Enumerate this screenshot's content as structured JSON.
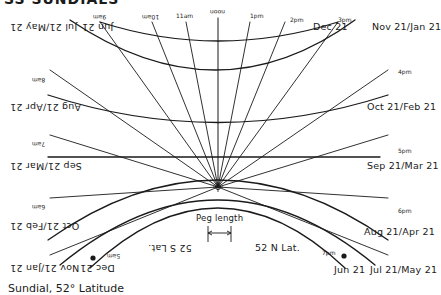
{
  "header": {
    "title_fragment": "SS SUNDIALS"
  },
  "caption": "Sundial, 52° Latitude",
  "peg": {
    "label": "Peg length"
  },
  "latitudes": {
    "north": "52 N Lat.",
    "south": "52 S Lat."
  },
  "north_dates": {
    "dec21": "Dec 21",
    "nov_jan": "Nov 21/Jan 21",
    "oct_feb": "Oct 21/Feb 21",
    "sep_mar": "Sep 21/Mar 21",
    "aug_apr": "Aug 21/Apr 21",
    "jul_may": "Jul 21/May 21",
    "jun21": "Jun 21"
  },
  "south_dates": {
    "jun21": "Jun 21",
    "jul_may": "Jul 21/May 21",
    "aug_apr": "Aug 21/Apr 21",
    "sep_mar": "Sep 21/Mar 21",
    "oct_feb": "Oct 21/Feb 21",
    "nov_jan": "Nov 21/Jan 21",
    "dec21": "Dec 21"
  },
  "north_times": {
    "t11": "11am\nwww",
    "noon": "noon",
    "t1": "1pm\nwww",
    "t2": "2pm\nwww",
    "t3": "3pm\nwww",
    "t4": "4pm\nwww",
    "t5": "5pm\nwww",
    "t6": "6pm\nwww",
    "t7": "7pm\nwww"
  },
  "south_times": {
    "t8": "8am\nmpm",
    "t9": "9am\nmpm",
    "t10": "10am\nmpm",
    "t7": "7am\nmpm",
    "t6": "6am\nmpm",
    "t5": "5am\nmpm"
  },
  "colors": {
    "ink": "#1a1a1a",
    "background": "#ffffff"
  }
}
